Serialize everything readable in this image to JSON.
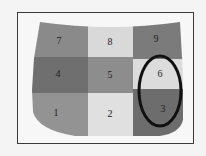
{
  "diagram": {
    "type": "car-hood-zone-grid",
    "zones": [
      {
        "id": "7",
        "label": "7",
        "row": 0,
        "col": 0,
        "color": "#8a8a8a"
      },
      {
        "id": "8",
        "label": "8",
        "row": 0,
        "col": 1,
        "color": "#d9d9d9"
      },
      {
        "id": "9",
        "label": "9",
        "row": 0,
        "col": 2,
        "color": "#7b7b7b"
      },
      {
        "id": "4",
        "label": "4",
        "row": 1,
        "col": 0,
        "color": "#6f6f6f"
      },
      {
        "id": "5",
        "label": "5",
        "row": 1,
        "col": 1,
        "color": "#8d8d8d"
      },
      {
        "id": "6",
        "label": "6",
        "row": 1,
        "col": 2,
        "color": "#dcdcdc"
      },
      {
        "id": "1",
        "label": "1",
        "row": 2,
        "col": 0,
        "color": "#939393"
      },
      {
        "id": "2",
        "label": "2",
        "row": 2,
        "col": 1,
        "color": "#e0e0e0"
      },
      {
        "id": "3",
        "label": "3",
        "row": 2,
        "col": 2,
        "color": "#6d6d6d"
      }
    ],
    "highlight": {
      "zones": [
        "6",
        "3"
      ],
      "shape": "ellipse",
      "stroke_color": "#111111"
    },
    "frame_border_color": "#3a3a3a"
  }
}
